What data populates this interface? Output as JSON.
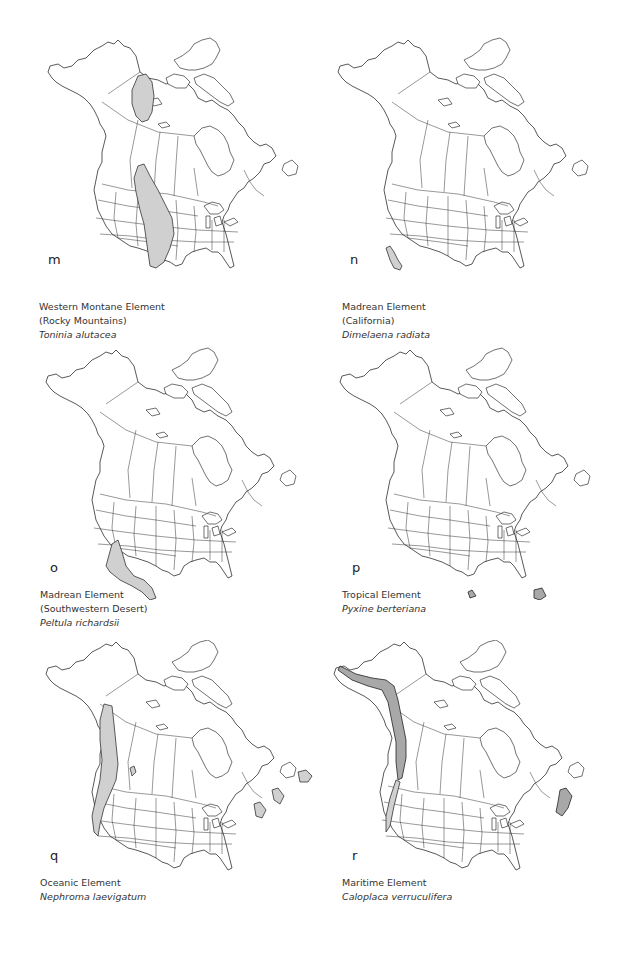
{
  "figure": {
    "panels": [
      {
        "letter": "m",
        "element": "Western Montane Element",
        "subtitle": "(Rocky Mountains)",
        "species": "Toninia alutacea",
        "range_regions": [
          "Northern Yukon / Mackenzie Mountains",
          "Rocky Mountains (Alberta/BC to New Mexico)"
        ]
      },
      {
        "letter": "n",
        "element": "Madrean Element",
        "subtitle": "(California)",
        "species": "Dimelaena radiata",
        "range_regions": [
          "Southern California coast"
        ]
      },
      {
        "letter": "o",
        "element": "Madrean Element",
        "subtitle": "(Southwestern Desert)",
        "species": "Peltula richardsii",
        "range_regions": [
          "Southern California / Arizona / New Mexico deserts into Mexico"
        ]
      },
      {
        "letter": "p",
        "element": "Tropical Element",
        "subtitle": "",
        "species": "Pyxine berteriana",
        "range_regions": [
          "South Texas tip",
          "South Florida"
        ]
      },
      {
        "letter": "q",
        "element": "Oceanic Element",
        "subtitle": "",
        "species": "Nephroma laevigatum",
        "range_regions": [
          "Pacific coast (SE Alaska to California)",
          "Newfoundland",
          "Maritime provinces / New England coast",
          "Inland BC pocket"
        ]
      },
      {
        "letter": "r",
        "element": "Maritime Element",
        "subtitle": "",
        "species": "Caloplaca verruculifera",
        "range_regions": [
          "Pacific coast (Aleutians/S Alaska to Oregon)",
          "Atlantic coast (Maritimes to Maine)"
        ]
      }
    ]
  },
  "colors": {
    "range_fill": "#d0d0d0",
    "outline": "#111111"
  }
}
